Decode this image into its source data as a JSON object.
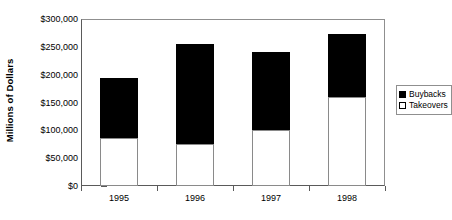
{
  "chart_data": {
    "type": "bar",
    "stacked": true,
    "title": "",
    "xlabel": "",
    "ylabel": "Millions of Dollars",
    "categories": [
      "1995",
      "1996",
      "1997",
      "1998"
    ],
    "series": [
      {
        "name": "Takeovers",
        "color": "#ffffff",
        "values": [
          86000,
          75000,
          100000,
          160000
        ]
      },
      {
        "name": "Buybacks",
        "color": "#000000",
        "values": [
          108000,
          181000,
          141000,
          113000
        ]
      }
    ],
    "totals": [
      194000,
      256000,
      241000,
      273000
    ],
    "ylim": [
      0,
      300000
    ],
    "ytick_values": [
      0,
      50000,
      100000,
      150000,
      200000,
      250000,
      300000
    ],
    "ytick_labels": [
      "$0",
      "$50,000",
      "$100,000",
      "$150,000",
      "$200,000",
      "$250,000",
      "$300,000"
    ],
    "grid": false,
    "legend_position": "right",
    "legend_entries": [
      {
        "label": "Buybacks",
        "swatch": "black"
      },
      {
        "label": "Takeovers",
        "swatch": "white"
      }
    ]
  }
}
